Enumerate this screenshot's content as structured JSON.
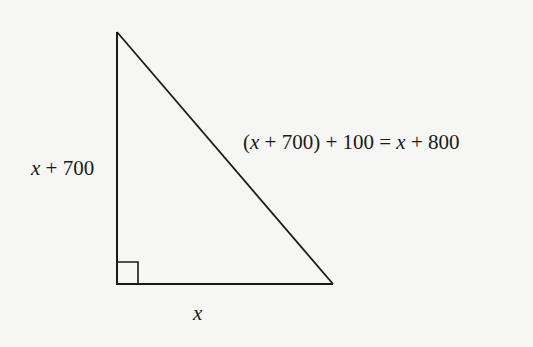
{
  "diagram": {
    "type": "right-triangle",
    "vertices": {
      "top": "top of left leg",
      "right_angle": "bottom-left",
      "acute": "bottom-right"
    },
    "labels": {
      "left_leg": {
        "var": "x",
        "rest": " + 700",
        "full": "x + 700"
      },
      "base": {
        "var": "x",
        "full": "x"
      },
      "hypotenuse": {
        "open": "(",
        "var1": "x",
        "mid": " + 700) + 100 = ",
        "var2": "x",
        "rest": " + 800",
        "full": "(x + 700) + 100 = x + 800"
      }
    },
    "right_angle_marker": true,
    "colors": {
      "background": "#f6f6f5",
      "stroke": "#1a1a1a",
      "text": "#1a1a1a"
    }
  }
}
